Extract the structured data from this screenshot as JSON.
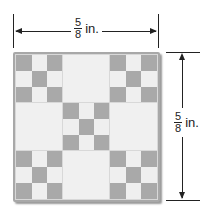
{
  "figure": {
    "type": "square quilt tile with dimension labels",
    "width_label": {
      "numerator": "5",
      "denominator": "8",
      "unit": "in."
    },
    "height_label": {
      "numerator": "5",
      "denominator": "8",
      "unit": "in."
    },
    "pattern": {
      "grid": "3x3 blocks",
      "blocks": [
        [
          "nine-patch",
          "plain",
          "nine-patch"
        ],
        [
          "plain",
          "nine-patch",
          "plain"
        ],
        [
          "nine-patch",
          "plain",
          "nine-patch"
        ]
      ],
      "nine_patch_layout": [
        [
          1,
          0,
          1
        ],
        [
          0,
          1,
          0
        ],
        [
          1,
          0,
          1
        ]
      ]
    },
    "colors": {
      "dark_square": "#a9a9a9",
      "light_square": "#efefef",
      "border": "#a8a8a8",
      "lines": "#222222"
    }
  }
}
